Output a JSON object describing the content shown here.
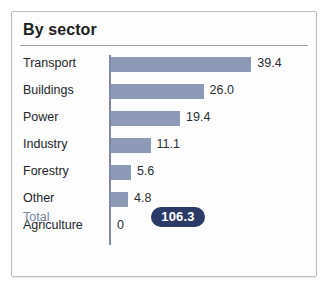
{
  "card": {
    "title": "By sector",
    "total_label": "Total",
    "total_value": "106.3"
  },
  "colors": {
    "bar_fill": "#8e99b7",
    "axis_line": "#7e8aa8",
    "badge_bg": "#2b3a66",
    "badge_text": "#ffffff",
    "label_text": "#23262c",
    "total_label_text": "#7b85a0",
    "card_border": "#b9bcc2",
    "title_rule": "#9ea2ab",
    "card_bg": "#fdfdfd"
  },
  "chart_data": {
    "type": "bar",
    "title": "By sector",
    "xlabel": "",
    "ylabel": "",
    "orientation": "horizontal",
    "grid": false,
    "legend": false,
    "xlim": [
      0,
      39.4
    ],
    "categories": [
      "Transport",
      "Buildings",
      "Power",
      "Industry",
      "Forestry",
      "Other",
      "Agriculture"
    ],
    "values": [
      39.4,
      26.0,
      19.4,
      11.1,
      5.6,
      4.8,
      0
    ],
    "value_labels": [
      "39.4",
      "26.0",
      "19.4",
      "11.1",
      "5.6",
      "4.8",
      "0"
    ],
    "total": 106.3,
    "total_text": "106.3"
  }
}
